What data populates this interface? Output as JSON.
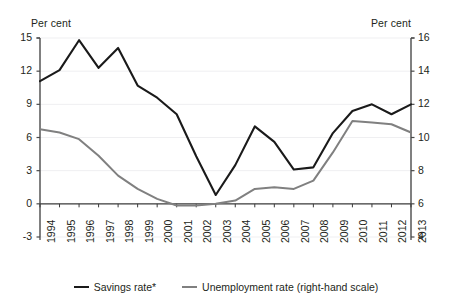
{
  "chart_data": {
    "type": "line",
    "title": "",
    "subtitle": "",
    "xlabel": "",
    "ylabel": "Per cent",
    "y2label": "Per cent",
    "grid": true,
    "legend_position": "bottom",
    "categories": [
      "1994",
      "1995",
      "1996",
      "1997",
      "1998",
      "1999",
      "2000",
      "2001",
      "2002",
      "2003",
      "2004",
      "2005",
      "2006",
      "2007",
      "2008",
      "2009",
      "2010",
      "2011",
      "2012",
      "2013"
    ],
    "left_axis": {
      "label": "Per cent",
      "ticks": [
        15,
        12,
        9,
        6,
        3,
        0,
        -3
      ],
      "ylim": [
        -3,
        15
      ]
    },
    "right_axis": {
      "label": "Per cent",
      "ticks": [
        16,
        14,
        12,
        10,
        8,
        6,
        4
      ],
      "ylim": [
        4,
        16
      ]
    },
    "series": [
      {
        "name": "Savings rate*",
        "axis": "left",
        "color": "#1a1a1a",
        "values": [
          11.1,
          12.1,
          14.8,
          12.3,
          14.1,
          10.7,
          9.6,
          8.1,
          4.3,
          0.8,
          3.5,
          7.0,
          5.6,
          3.1,
          3.3,
          6.4,
          8.4,
          9.0,
          8.1,
          9.0
        ]
      },
      {
        "name": "Unemployment rate (right-hand scale)",
        "axis": "right",
        "color": "#808080",
        "values": [
          10.5,
          10.3,
          9.9,
          8.9,
          7.7,
          6.9,
          6.3,
          5.9,
          5.9,
          6.0,
          6.2,
          6.9,
          7.0,
          6.9,
          7.4,
          9.1,
          11.0,
          10.9,
          10.8,
          10.3
        ]
      }
    ]
  },
  "legend": {
    "entries": [
      {
        "label": "Savings rate*",
        "color": "#1a1a1a"
      },
      {
        "label": "Unemployment rate (right-hand scale)",
        "color": "#808080"
      }
    ]
  },
  "axes": {
    "left_unit": "Per cent",
    "right_unit": "Per cent"
  }
}
